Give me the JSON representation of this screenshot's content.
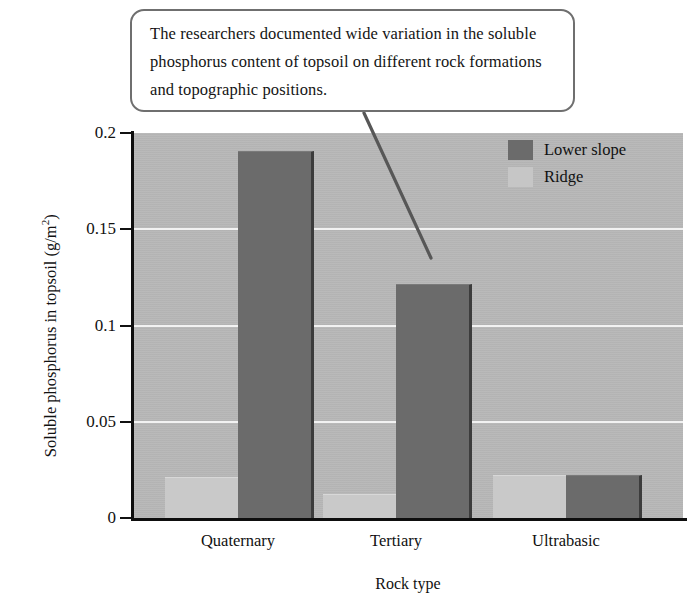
{
  "callout": {
    "text": "The researchers documented wide variation in the soluble phosphorus content of topsoil on different rock formations and topographic positions.",
    "border_color": "#6f6f6f",
    "background_color": "#ffffff",
    "pointer_icon": "leader-line-icon"
  },
  "legend": {
    "position": "top-right",
    "items": [
      {
        "label": "Lower slope",
        "color": "#6b6b6b"
      },
      {
        "label": "Ridge",
        "color": "#c6c6c6"
      }
    ]
  },
  "axes": {
    "y_title_main": "Soluble phosphorus in topsoil (g/m",
    "y_title_sup": "2",
    "y_title_close": ")",
    "x_title": "Rock type",
    "y_ticks": [
      "0",
      "0.05",
      "0.1",
      "0.15",
      "0.2"
    ]
  },
  "chart_data": {
    "type": "bar",
    "title": "",
    "xlabel": "Rock type",
    "ylabel": "Soluble phosphorus in topsoil (g/m2)",
    "categories": [
      "Quaternary",
      "Tertiary",
      "Ultrabasic"
    ],
    "series": [
      {
        "name": "Ridge",
        "color": "#c9c9c9",
        "values": [
          0.021,
          0.012,
          0.022
        ]
      },
      {
        "name": "Lower slope",
        "color": "#6b6b6b",
        "values": [
          0.19,
          0.121,
          0.022
        ]
      }
    ],
    "ylim": [
      0,
      0.2
    ],
    "yticks": [
      0,
      0.05,
      0.1,
      0.15,
      0.2
    ],
    "grid": true,
    "grid_color": "#f2f2f2",
    "plot_background": "#b7b7b7",
    "legend_position": "top-right"
  }
}
